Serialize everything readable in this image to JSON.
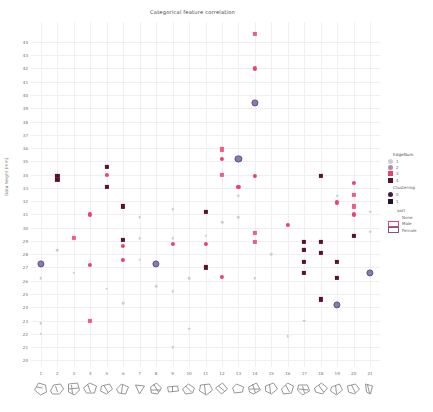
{
  "chart_data": {
    "type": "scatter",
    "title": "Categorical feature correlation",
    "xlabel": "",
    "ylabel": "Data height (mm)",
    "xlim": [
      0.4,
      21.6
    ],
    "ylim": [
      19.5,
      45.5
    ],
    "grid": true,
    "legend_position": "right",
    "xticks": [
      1,
      2,
      3,
      4,
      5,
      6,
      7,
      8,
      9,
      10,
      11,
      12,
      13,
      14,
      15,
      16,
      17,
      18,
      19,
      20,
      21
    ],
    "yticks": [
      44,
      43,
      42,
      41,
      40,
      39,
      38,
      37,
      36,
      35,
      34,
      33,
      32,
      31,
      30,
      29,
      28,
      27,
      26,
      25,
      24,
      23,
      22,
      21,
      20
    ],
    "series": [
      {
        "name": "EdgeNum 4 / crimson",
        "color": "#e8436a",
        "marker": "circle",
        "points": [
          [
            4.0,
            31.0
          ],
          [
            4.0,
            27.2
          ],
          [
            5.0,
            34.0
          ],
          [
            6.0,
            28.6
          ],
          [
            6.0,
            27.6
          ],
          [
            9.0,
            28.8
          ],
          [
            11.0,
            28.8
          ],
          [
            12.0,
            35.2
          ],
          [
            12.0,
            26.3
          ],
          [
            13.0,
            33.1
          ],
          [
            14.0,
            42.0
          ],
          [
            14.0,
            33.9
          ],
          [
            16.0,
            30.2
          ],
          [
            19.0,
            31.9
          ],
          [
            20.0,
            33.4
          ],
          [
            20.0,
            31.0
          ]
        ]
      },
      {
        "name": "EdgeNum 3 / pink-square",
        "color": "#eb5f86",
        "marker": "square",
        "points": [
          [
            3.0,
            29.2
          ],
          [
            4.0,
            23.0
          ],
          [
            12.0,
            35.9
          ],
          [
            12.0,
            34.0
          ],
          [
            14.0,
            44.6
          ],
          [
            14.0,
            29.6
          ],
          [
            14.0,
            28.9
          ],
          [
            17.0,
            28.3
          ],
          [
            20.0,
            32.5
          ],
          [
            20.0,
            31.6
          ]
        ]
      },
      {
        "name": "EdgeNum 2 / dark-maroon",
        "color": "#5c1030",
        "marker": "square",
        "points": [
          [
            2.0,
            33.9
          ],
          [
            2.0,
            33.6
          ],
          [
            5.0,
            34.6
          ],
          [
            5.0,
            33.1
          ],
          [
            6.0,
            31.6
          ],
          [
            6.0,
            29.1
          ],
          [
            11.0,
            31.2
          ],
          [
            11.0,
            27.0
          ],
          [
            17.0,
            28.9
          ],
          [
            17.0,
            28.3
          ],
          [
            17.0,
            27.4
          ],
          [
            17.0,
            26.6
          ],
          [
            18.0,
            33.9
          ],
          [
            18.0,
            28.9
          ],
          [
            18.0,
            28.1
          ],
          [
            18.0,
            24.6
          ],
          [
            19.0,
            27.4
          ],
          [
            19.0,
            26.2
          ],
          [
            20.0,
            29.4
          ]
        ]
      },
      {
        "name": "EdgeNum 1 / purple-ring",
        "color": "#6e5b9e",
        "marker": "circle-ring",
        "points": [
          [
            1.0,
            27.3
          ],
          [
            8.0,
            27.3
          ],
          [
            14.0,
            39.4
          ],
          [
            13.0,
            35.2
          ],
          [
            21.0,
            26.6
          ],
          [
            19.0,
            24.2
          ]
        ]
      },
      {
        "name": "Clustering 0 / light-grey",
        "color": "#cfcbd4",
        "marker": "circle",
        "points": [
          [
            1.0,
            26.2
          ],
          [
            1.0,
            22.8
          ],
          [
            1.0,
            22.0
          ],
          [
            2.0,
            28.3
          ],
          [
            3.0,
            26.6
          ],
          [
            5.0,
            25.4
          ],
          [
            6.0,
            24.3
          ],
          [
            7.0,
            30.8
          ],
          [
            7.0,
            29.2
          ],
          [
            7.0,
            27.6
          ],
          [
            8.0,
            25.6
          ],
          [
            9.0,
            31.4
          ],
          [
            9.0,
            29.2
          ],
          [
            9.0,
            25.2
          ],
          [
            9.0,
            21.0
          ],
          [
            10.0,
            26.2
          ],
          [
            10.0,
            22.4
          ],
          [
            11.0,
            29.4
          ],
          [
            12.0,
            30.4
          ],
          [
            13.0,
            32.4
          ],
          [
            13.0,
            30.8
          ],
          [
            14.0,
            26.2
          ],
          [
            15.0,
            28.0
          ],
          [
            16.0,
            21.8
          ],
          [
            17.0,
            23.0
          ],
          [
            19.0,
            32.4
          ],
          [
            21.0,
            31.2
          ],
          [
            21.0,
            29.7
          ]
        ]
      }
    ]
  },
  "legend": {
    "group1": {
      "title": "EdgeNum",
      "items": [
        {
          "label": "1",
          "color": "#cfcbd4",
          "shape": "circle"
        },
        {
          "label": "2",
          "color": "#b08aa8",
          "shape": "circle"
        },
        {
          "label": "3",
          "color": "#e8436a",
          "shape": "square"
        },
        {
          "label": "4",
          "color": "#5c1030",
          "shape": "square"
        }
      ]
    },
    "group2": {
      "title": "Clustering",
      "items": [
        {
          "label": "0",
          "color": "#3a2040",
          "shape": "circle"
        },
        {
          "label": "1",
          "color": "#2a1030",
          "shape": "square"
        }
      ]
    },
    "group3": {
      "title": "sort",
      "items": [
        {
          "label": "None",
          "color": "#ffffff",
          "edge": "#ffffff"
        },
        {
          "label": "Male",
          "color": "#ffffff",
          "edge": "#e8436a"
        },
        {
          "label": "Female",
          "color": "#ffffff",
          "edge": "#6e5b9e"
        }
      ]
    }
  },
  "xglyphs": [
    "M2,9 L6,2 L13,4 L14,11 L8,14 Z M4,6 L10,7",
    "M2,10 L5,4 L12,3 L15,8 L11,13 L4,13 Z M7,5 L9,11",
    "M3,3 L12,2 L14,9 L9,14 L3,11 Z M6,4 L7,13 M3,8 L13,7",
    "M2,7 L8,2 L15,5 L13,12 L5,12 Z M6,3 L9,11",
    "M3,5 L11,3 L14,8 L8,13 L2,10 Z M5,4 L10,12",
    "M2,8 L7,3 L14,6 L11,13 L4,12 Z M8,4 L7,12",
    "M4,4 L13,5 L8,13 Z",
    "M3,6 L9,2 L14,7 L10,13 L4,12 Z M6,3 L11,11 M3,9 L13,9",
    "M3,6 L13,5 L14,10 L4,11 Z M8,5 L8,11",
    "M2,8 L8,3 L14,7 L12,12 L5,13 Z M5,5 L11,11",
    "M3,4 L12,3 L15,9 L9,14 L2,10 Z M7,4 L8,13",
    "M2,7 L9,2 L14,8 L8,13 Z M5,5 L11,10",
    "M3,7 L7,3 L14,6 L13,11 L5,12 Z",
    "M2,6 L10,2 L14,9 L7,13 L3,11 Z M6,3 L9,12 M3,8 L13,8",
    "M3,5 L11,2 L15,8 L9,13 L3,10 Z M7,3 L8,12",
    "M2,8 L8,2 L14,5 L12,12 L4,13 Z M6,4 L10,11",
    "M3,4 L12,4 L14,10 L7,14 L2,9 Z M7,5 L9,12 M3,8 L13,9",
    "M2,7 L9,2 L15,7 L10,13 L3,11 Z M6,4 L11,11",
    "M3,6 L11,3 L14,9 L8,14 L2,10 Z M7,4 L8,13",
    "M2,5 L10,3 L14,8 L9,13 L3,11 Z M6,4 L10,12",
    "M4,3 L11,5 L9,13 L5,11 Z M6,4 L8,12"
  ]
}
